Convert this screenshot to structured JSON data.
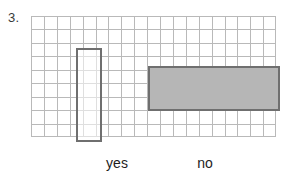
{
  "problem": {
    "number": "3."
  },
  "chart_data": {
    "type": "bar",
    "title": "",
    "xlabel": "",
    "ylabel": "",
    "categories": [
      "yes",
      "no"
    ],
    "values": [
      7,
      3.3
    ],
    "orientation": "mixed",
    "grid": true,
    "grid_columns": 19,
    "grid_rows": 9,
    "legend": "none",
    "ylim": [
      0,
      9
    ],
    "bars": [
      {
        "category": "yes",
        "label": "yes",
        "orientation": "vertical",
        "grid_width_cells": 2,
        "grid_height_cells": 7,
        "fill": "#ffffff",
        "stroke": "#6f6f6f"
      },
      {
        "category": "no",
        "label": "no",
        "orientation": "horizontal",
        "grid_width_cells": 10,
        "grid_height_cells": 3.3,
        "fill": "#b6b6b6",
        "stroke": "#6f6f6f"
      }
    ]
  },
  "colors": {
    "grid_line": "#b9b9b9",
    "bar_stroke": "#6f6f6f",
    "bar_fill_gray": "#b6b6b6",
    "bar_fill_white": "#ffffff",
    "text": "#1d1d1d",
    "background": "#ffffff"
  }
}
